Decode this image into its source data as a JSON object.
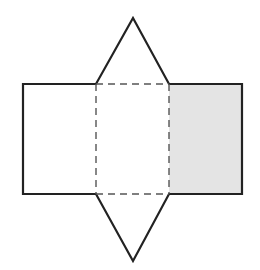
{
  "diagram": {
    "colors": {
      "stroke": "#222222",
      "dash_stroke": "#555555",
      "shaded_fill": "#e4e4e4",
      "background": "#ffffff"
    },
    "faces": [
      {
        "id": "left-rectangle",
        "type": "rectangle",
        "shaded": false
      },
      {
        "id": "middle-rectangle",
        "type": "rectangle",
        "shaded": false,
        "fold_edges": "dashed"
      },
      {
        "id": "right-rectangle",
        "type": "rectangle",
        "shaded": true
      },
      {
        "id": "top-triangle",
        "type": "triangle",
        "shaded": false
      },
      {
        "id": "bottom-triangle",
        "type": "triangle",
        "shaded": false
      }
    ]
  }
}
